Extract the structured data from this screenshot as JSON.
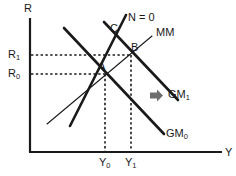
{
  "figure": {
    "type": "economic-schematic-diagram",
    "background_color": "#ffffff",
    "line_color": "#1a1a1a",
    "arrow_color": "#6e6e6e",
    "width": 236,
    "height": 176
  },
  "axes": {
    "y_axis_label": "R",
    "x_axis_label": "Y",
    "origin": {
      "x": 30,
      "y": 152
    },
    "y_axis_top": 18,
    "x_axis_right": 222
  },
  "tick_labels": {
    "y": [
      {
        "name": "R_1",
        "text": "R",
        "sub": "1",
        "value_y": 55
      },
      {
        "name": "R_0",
        "text": "R",
        "sub": "0",
        "value_y": 74
      }
    ],
    "x": [
      {
        "name": "Y_0",
        "text": "Y",
        "sub": "0",
        "value_x": 105
      },
      {
        "name": "Y_1",
        "text": "Y",
        "sub": "1",
        "value_x": 131
      }
    ]
  },
  "curves": [
    {
      "name": "GM_0",
      "label_text": "GM",
      "label_sub": "0",
      "style": "thick"
    },
    {
      "name": "GM_1",
      "label_text": "GM",
      "label_sub": "1",
      "style": "thick"
    },
    {
      "name": "MM",
      "label_text": "MM",
      "label_sub": "",
      "style": "thin"
    },
    {
      "name": "N_zero",
      "label_text": "N = 0",
      "label_sub": "",
      "style": "thick"
    },
    {
      "name": "C_curve",
      "label_text": "C",
      "label_sub": "",
      "style": "thick"
    }
  ],
  "equilibrium_points": [
    {
      "name": "A",
      "label": "A",
      "x": 105,
      "y": 74
    },
    {
      "name": "B",
      "label": "B",
      "x": 131,
      "y": 55
    }
  ],
  "shift_arrow": {
    "name": "rightward-shift-arrow",
    "direction": "right",
    "color": "#6e6e6e",
    "x": 150,
    "y": 95
  },
  "guide_lines": {
    "style": "dotted",
    "horizontal": [
      "R_1",
      "R_0"
    ],
    "vertical": [
      "Y_0",
      "Y_1"
    ]
  }
}
